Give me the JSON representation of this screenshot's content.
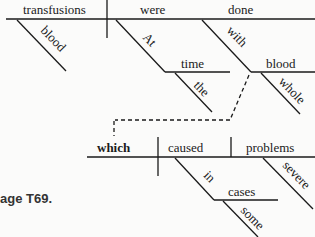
{
  "diagram": {
    "main_clause": {
      "subject": "transfusions",
      "verb_aux": "were",
      "verb": "done",
      "subject_modifier": "blood",
      "phrase1": {
        "preposition": "At",
        "object": "time",
        "modifier": "the"
      },
      "phrase2": {
        "preposition": "with",
        "object": "blood",
        "modifier": "whole"
      }
    },
    "relative_clause": {
      "subject": "which",
      "verb": "caused",
      "object": "problems",
      "object_modifier": "severe",
      "phrase": {
        "preposition": "in",
        "object": "cases",
        "modifier": "some"
      }
    },
    "caption": "age T69."
  }
}
